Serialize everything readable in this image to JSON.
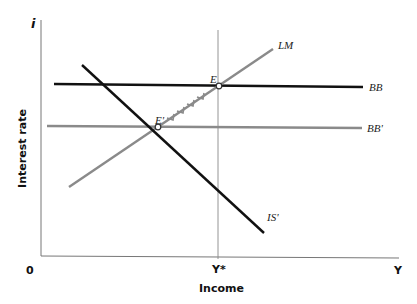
{
  "diagram": {
    "type": "IS-LM-BB diagram",
    "axes": {
      "y_symbol": "i",
      "y_label": "Interest rate",
      "x_symbol": "Y",
      "x_label": "Income",
      "origin": "0",
      "x_marker": "Y*"
    },
    "curves": {
      "lm": "LM",
      "bb": "BB",
      "bb_prime": "BB'",
      "is_prime": "IS'"
    },
    "points": {
      "e": "E",
      "e_prime": "E'"
    },
    "colors": {
      "black_line": "#111111",
      "gray_line": "#8a8a8a",
      "axis": "#777777"
    }
  }
}
